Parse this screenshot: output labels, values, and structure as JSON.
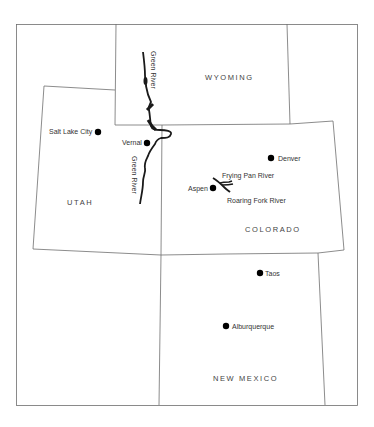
{
  "map": {
    "states": [
      {
        "name": "WYOMING"
      },
      {
        "name": "UTAH"
      },
      {
        "name": "COLORADO"
      },
      {
        "name": "NEW MEXICO"
      }
    ],
    "cities": [
      {
        "name": "Salt Lake City"
      },
      {
        "name": "Vernal"
      },
      {
        "name": "Denver"
      },
      {
        "name": "Aspen"
      },
      {
        "name": "Taos"
      },
      {
        "name": "Alburquerque"
      }
    ],
    "rivers": [
      {
        "name": "Green River"
      },
      {
        "name": "Green River"
      },
      {
        "name": "Frying Pan River"
      },
      {
        "name": "Roaring Fork River"
      }
    ],
    "colors": {
      "border": "#6e6e6e",
      "river": "#1a1a1a",
      "city_dot": "#000000",
      "background": "#ffffff"
    }
  }
}
